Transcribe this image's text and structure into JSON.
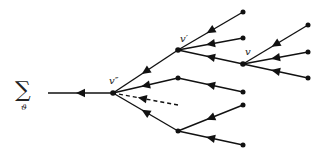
{
  "diagram": {
    "type": "tree",
    "title": "",
    "sum_symbol": "∑",
    "sum_subscript": "ϑ",
    "colors": {
      "line": "#111111",
      "text": "#222222",
      "background": "#ffffff"
    },
    "nodes": [
      {
        "id": "root-end",
        "label": ""
      },
      {
        "id": "v2",
        "label": "v″"
      },
      {
        "id": "v1",
        "label": "v′"
      },
      {
        "id": "m1",
        "label": ""
      },
      {
        "id": "d1",
        "label": ""
      },
      {
        "id": "m2",
        "label": ""
      },
      {
        "id": "v",
        "label": "v"
      },
      {
        "id": "l1",
        "label": ""
      },
      {
        "id": "l2",
        "label": ""
      },
      {
        "id": "l3",
        "label": ""
      },
      {
        "id": "l4",
        "label": ""
      },
      {
        "id": "l5",
        "label": ""
      },
      {
        "id": "l6",
        "label": ""
      },
      {
        "id": "l7",
        "label": ""
      },
      {
        "id": "l8",
        "label": ""
      }
    ],
    "edges": [
      {
        "from": "v2",
        "to": "root-end",
        "style": "solid"
      },
      {
        "from": "v1",
        "to": "v2",
        "style": "solid"
      },
      {
        "from": "m1",
        "to": "v2",
        "style": "solid"
      },
      {
        "from": "d1",
        "to": "v2",
        "style": "dashed"
      },
      {
        "from": "m2",
        "to": "v2",
        "style": "solid"
      },
      {
        "from": "l1",
        "to": "v1",
        "style": "solid"
      },
      {
        "from": "l2",
        "to": "v1",
        "style": "solid"
      },
      {
        "from": "v",
        "to": "v1",
        "style": "solid"
      },
      {
        "from": "l3",
        "to": "v",
        "style": "solid"
      },
      {
        "from": "l4",
        "to": "v",
        "style": "solid"
      },
      {
        "from": "l5",
        "to": "v",
        "style": "solid"
      },
      {
        "from": "l6",
        "to": "m1",
        "style": "solid"
      },
      {
        "from": "l7",
        "to": "m2",
        "style": "solid"
      },
      {
        "from": "l8",
        "to": "m2",
        "style": "solid"
      }
    ]
  }
}
